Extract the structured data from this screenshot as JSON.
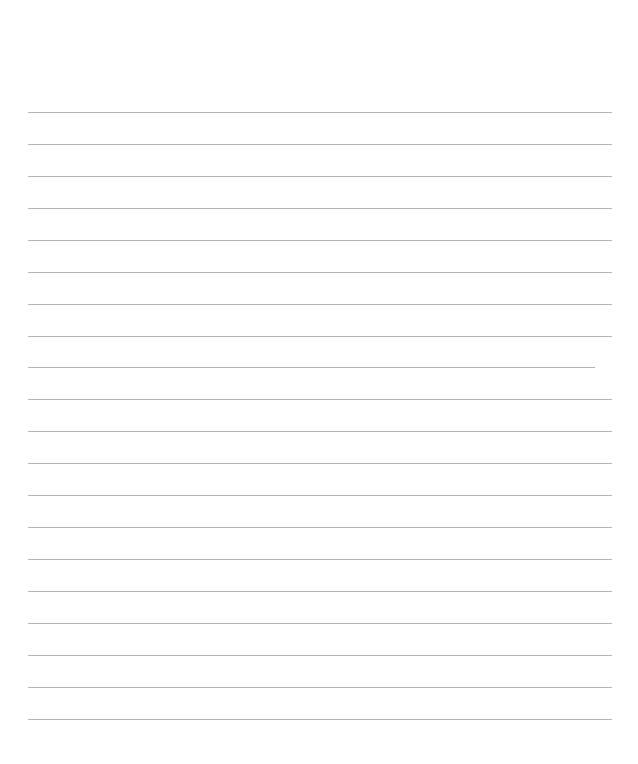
{
  "page": {
    "type": "lined-paper",
    "background": "#ffffff",
    "line_color": "#b4b4b4",
    "line_count": 20,
    "first_line_y": 112,
    "line_spacing": 32,
    "line_left": 28,
    "line_right": 612,
    "lines": [
      {
        "y": 112,
        "x1": 28,
        "x2": 612
      },
      {
        "y": 144,
        "x1": 28,
        "x2": 612
      },
      {
        "y": 176,
        "x1": 28,
        "x2": 612
      },
      {
        "y": 208,
        "x1": 28,
        "x2": 612
      },
      {
        "y": 240,
        "x1": 28,
        "x2": 612
      },
      {
        "y": 272,
        "x1": 28,
        "x2": 612
      },
      {
        "y": 304,
        "x1": 28,
        "x2": 612
      },
      {
        "y": 336,
        "x1": 28,
        "x2": 612
      },
      {
        "y": 367,
        "x1": 28,
        "x2": 595
      },
      {
        "y": 399,
        "x1": 28,
        "x2": 612
      },
      {
        "y": 431,
        "x1": 28,
        "x2": 612
      },
      {
        "y": 463,
        "x1": 28,
        "x2": 612
      },
      {
        "y": 495,
        "x1": 28,
        "x2": 612
      },
      {
        "y": 527,
        "x1": 28,
        "x2": 612
      },
      {
        "y": 559,
        "x1": 28,
        "x2": 612
      },
      {
        "y": 591,
        "x1": 28,
        "x2": 612
      },
      {
        "y": 623,
        "x1": 28,
        "x2": 612
      },
      {
        "y": 655,
        "x1": 28,
        "x2": 612
      },
      {
        "y": 687,
        "x1": 28,
        "x2": 612
      },
      {
        "y": 719,
        "x1": 28,
        "x2": 612
      }
    ]
  }
}
